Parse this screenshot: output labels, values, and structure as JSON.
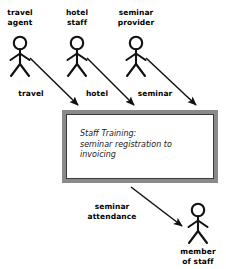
{
  "diagram": {
    "actors": [
      {
        "id": "travel-agent",
        "label": "travel\nagent",
        "x": 20,
        "y": 38
      },
      {
        "id": "hotel-staff",
        "label": "hotel\nstaff",
        "x": 77,
        "y": 38
      },
      {
        "id": "seminar-provider",
        "label": "seminar\nprovider",
        "x": 136,
        "y": 38
      },
      {
        "id": "member-of-staff",
        "label": "member\nof staff",
        "x": 198,
        "y": 210
      }
    ],
    "actor_labels": {
      "travel_agent": "travel\nagent",
      "hotel_staff": "hotel\nstaff",
      "seminar_provider": "seminar\nprovider",
      "member_of_staff": "member\nof staff"
    },
    "process": {
      "text": "Staff Training:\nseminar registration to\ninvoicing",
      "border_color": "#8a8a8a",
      "fill_color": "#ffffff"
    },
    "flows": [
      {
        "id": "travel",
        "label": "travel",
        "from": "travel-agent",
        "to": "process"
      },
      {
        "id": "hotel",
        "label": "hotel",
        "from": "hotel-staff",
        "to": "process"
      },
      {
        "id": "seminar",
        "label": "seminar",
        "from": "seminar-provider",
        "to": "process"
      },
      {
        "id": "seminar-attendance",
        "label": "seminar\nattendance",
        "from": "process",
        "to": "member-of-staff"
      }
    ],
    "flow_labels": {
      "travel": "travel",
      "hotel": "hotel",
      "seminar": "seminar",
      "seminar_attendance": "seminar\nattendance"
    },
    "colors": {
      "stroke": "#000000",
      "background": "#ffffff",
      "box_border": "#8a8a8a"
    }
  }
}
